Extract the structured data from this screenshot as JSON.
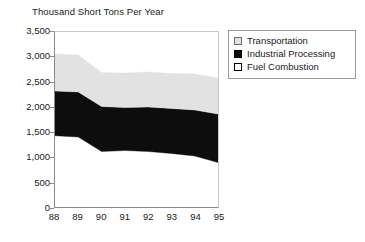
{
  "chart_data": {
    "type": "area",
    "title": "Thousand Short Tons Per Year",
    "xlabel": "",
    "ylabel": "",
    "stacked": true,
    "grid": false,
    "legend_position": "right",
    "categories": [
      "88",
      "89",
      "90",
      "91",
      "92",
      "93",
      "94",
      "95"
    ],
    "ylim": [
      0,
      3500
    ],
    "yticks": [
      0,
      500,
      1000,
      1500,
      2000,
      2500,
      3000,
      3500
    ],
    "ytick_labels": [
      "0",
      "500",
      "1,000",
      "1,500",
      "2,000",
      "2,500",
      "3,000",
      "3,500"
    ],
    "series": [
      {
        "name": "Fuel Combustion",
        "color": "#ffffff",
        "values": [
          1425,
          1400,
          1110,
          1130,
          1110,
          1070,
          1020,
          890
        ]
      },
      {
        "name": "Industrial Processing",
        "color": "#0d0d0d",
        "values": [
          895,
          900,
          900,
          860,
          890,
          900,
          920,
          970
        ]
      },
      {
        "name": "Transportation",
        "color": "#e2e2e2",
        "values": [
          740,
          740,
          680,
          690,
          700,
          700,
          720,
          720
        ]
      }
    ],
    "cumulative_bounds": {
      "fuel_combustion_top": [
        1425,
        1400,
        1110,
        1130,
        1110,
        1070,
        1020,
        890
      ],
      "industrial_top": [
        2320,
        2300,
        2010,
        1990,
        2000,
        1970,
        1940,
        1860
      ],
      "stack_top": [
        3060,
        3040,
        2690,
        2680,
        2700,
        2670,
        2660,
        2580
      ]
    }
  },
  "legend": {
    "items": [
      {
        "label": "Transportation",
        "swatch": "#e2e2e2",
        "border": "#6e6e6e"
      },
      {
        "label": "Industrial Processing",
        "swatch": "#0d0d0d",
        "border": "#000000"
      },
      {
        "label": "Fuel Combustion",
        "swatch": "#ffffff",
        "border": "#000000"
      }
    ]
  }
}
